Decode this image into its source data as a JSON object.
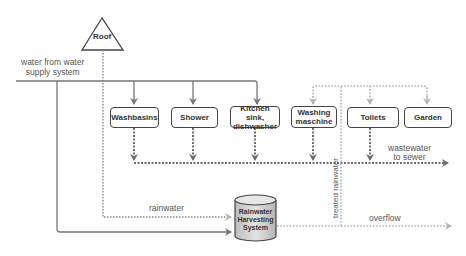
{
  "diagram": {
    "roof": {
      "label": "Roof"
    },
    "supply": {
      "line1": "water from water",
      "line2": "supply system"
    },
    "fixtures": [
      {
        "id": "washbasins",
        "line1": "Washbasins",
        "line2": ""
      },
      {
        "id": "shower",
        "line1": "Shower",
        "line2": ""
      },
      {
        "id": "kitchen",
        "line1": "Kitchen sink,",
        "line2": "dishwasher"
      },
      {
        "id": "washing",
        "line1": "Washing",
        "line2": "maschine"
      },
      {
        "id": "toilets",
        "line1": "Toilets",
        "line2": ""
      },
      {
        "id": "garden",
        "line1": "Garden",
        "line2": ""
      }
    ],
    "tank": {
      "line1": "Rainwater",
      "line2": "Harvesting",
      "line3": "System"
    },
    "labels": {
      "rainwater": "rainwater",
      "treated_rainwater": "treated rainwater",
      "overflow": "overflow",
      "wastewater_line1": "wastewater",
      "wastewater_line2": "to sewer"
    },
    "colors": {
      "solid_line": "#777777",
      "dotted_dark": "#6e6e6e",
      "dotted_light": "#b5b5b5",
      "box_border": "#444444",
      "tank_fill": "#d0d0d0"
    }
  }
}
